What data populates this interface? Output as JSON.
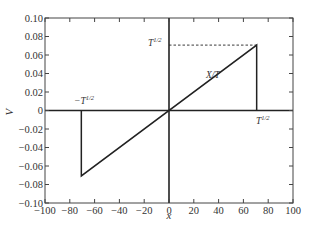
{
  "chart_data": {
    "type": "line",
    "title": "",
    "xlabel": "x",
    "ylabel": "V",
    "xlim": [
      -100,
      100
    ],
    "ylim": [
      -0.1,
      0.1
    ],
    "xticks": [
      -100,
      -80,
      -60,
      -40,
      -20,
      0,
      20,
      40,
      60,
      80,
      100
    ],
    "yticks": [
      0.1,
      0.08,
      0.06,
      0.04,
      0.02,
      0,
      -0.02,
      -0.04,
      -0.06,
      -0.08,
      -0.1
    ],
    "xtick_labels": [
      "−100",
      "−80",
      "−60",
      "−40",
      "−20",
      "0",
      "20",
      "40",
      "60",
      "80",
      "100"
    ],
    "ytick_labels": [
      "0.10",
      "0.08",
      "0.06",
      "0.04",
      "0.02",
      "0",
      "−0.02",
      "−0.04",
      "−0.06",
      "−0.08",
      "−0.10"
    ],
    "grid": false,
    "series": [
      {
        "name": "X/T",
        "style": "solid",
        "x": [
          -70.7,
          -70.7,
          70.7,
          70.7
        ],
        "y": [
          0,
          -0.0707,
          0.0707,
          0
        ]
      },
      {
        "name": "T^{1/2} reference",
        "style": "dashed",
        "x": [
          0,
          70.7
        ],
        "y": [
          0.0707,
          0.0707
        ]
      }
    ],
    "annotations": [
      {
        "text": "X/T",
        "x": 30,
        "y": 0.035
      },
      {
        "text": "T¹ᐟ²",
        "label": "T^{1/2}",
        "x": -8,
        "y": 0.0707
      },
      {
        "text": "−T^{1/2}",
        "label": "-T^{1/2}",
        "x": -70.7,
        "y": 0.005
      },
      {
        "text": "T^{1/2}",
        "label": "T^{1/2}",
        "x": 70.7,
        "y": -0.008
      }
    ]
  },
  "labels": {
    "xlabel": "x",
    "ylabel": "V",
    "line_label": "X/T",
    "t_half_top": "T",
    "t_half_top_sup": "1/2",
    "neg_t_half": "−T",
    "neg_t_half_sup": "1/2",
    "t_half_right": "T",
    "t_half_right_sup": "1/2"
  }
}
